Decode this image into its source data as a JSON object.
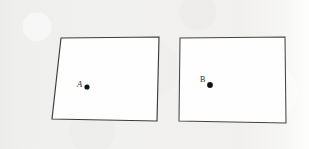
{
  "figure": {
    "background_color": "#f1f0ef",
    "paper_right_margin_color": "#fdfdfc",
    "ink_color": "#3c3c3c",
    "dot_color": "#141414",
    "shapes": [
      {
        "id": "A",
        "name": "quadrilateral-a",
        "kind": "slanted-quadrilateral",
        "label": "A",
        "stroke": "#3c3c3c",
        "fill": "#fefefe",
        "vertices": [
          {
            "x": 61,
            "y": 38
          },
          {
            "x": 159,
            "y": 37
          },
          {
            "x": 157,
            "y": 121
          },
          {
            "x": 52,
            "y": 119
          }
        ],
        "point": {
          "x": 87,
          "y": 87,
          "radius": 2.6
        },
        "label_position": {
          "x": 77,
          "y": 87
        }
      },
      {
        "id": "B",
        "name": "quadrilateral-b",
        "kind": "upright-rectangle",
        "label": "B",
        "stroke": "#444444",
        "fill": "#fefefe",
        "vertices": [
          {
            "x": 180,
            "y": 38
          },
          {
            "x": 285,
            "y": 37
          },
          {
            "x": 286,
            "y": 123
          },
          {
            "x": 179,
            "y": 121
          }
        ],
        "point": {
          "x": 210,
          "y": 85,
          "radius": 2.9
        },
        "label_position": {
          "x": 200,
          "y": 82
        }
      }
    ]
  }
}
